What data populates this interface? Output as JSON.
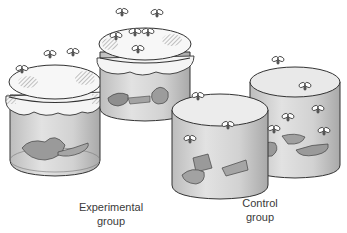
{
  "figure": {
    "groups": [
      {
        "id": "experimental",
        "label_line1": "Experimental",
        "label_line2": "group",
        "jars": 2,
        "cover": "gauze cloth",
        "flies_inside": false
      },
      {
        "id": "control",
        "label_line1": "Control",
        "label_line2": "group",
        "jars": 2,
        "cover": "none (open)",
        "flies_inside": true
      }
    ],
    "colors": {
      "glass": "#d8d8d8",
      "glass_dark": "#b5b5b5",
      "cloth": "#f4f4f4",
      "meat": "#9a9a9a",
      "outline": "#333333",
      "label_text": "#3a3a3a"
    }
  }
}
